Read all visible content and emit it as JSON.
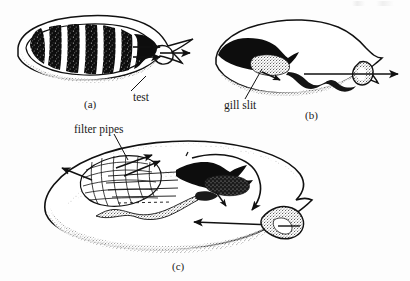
{
  "figure": {
    "background_color": "#fdfdfd",
    "ink_color": "#111111",
    "panels": [
      {
        "id": "a",
        "letter": "(a)",
        "description": "Whole ascidian in side view; dark banded pharyngeal basket inside a translucent tunic; two straight arrows leave the basket to the right and a third arrow passes out through the atrial siphon.",
        "labels": [
          "test"
        ],
        "arrow_count": 3
      },
      {
        "id": "b",
        "letter": "(b)",
        "description": "Cutaway side view showing the dark gut mass, the stippled gill region and a long straight arrow passing out through the siphon on the right.",
        "labels": [
          "gill slit"
        ],
        "arrow_count": 2
      },
      {
        "id": "c",
        "letter": "(c)",
        "description": "Large three quarter cutaway view showing the mesh of filter pipes with radiating arrows, a sweeping curved arrow over the body and an inflow arrow entering the siphon at lower right.",
        "labels": [
          "filter pipes"
        ],
        "arrow_count": 7
      }
    ],
    "annotations": {
      "test": "test",
      "gill_slit": "gill slit",
      "filter_pipes": "filter pipes"
    },
    "panel_letters": {
      "a": "(a)",
      "b": "(b)",
      "c": "(c)"
    }
  }
}
